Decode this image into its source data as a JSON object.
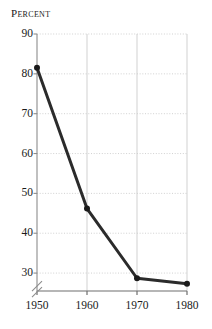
{
  "chart_data": {
    "type": "line",
    "title": "",
    "ylabel": "Percent",
    "xlabel": "",
    "x": [
      1950,
      1960,
      1970,
      1980
    ],
    "categories": [
      "1950",
      "1960",
      "1970",
      "1980"
    ],
    "values": [
      81.5,
      46.2,
      28.7,
      27.3
    ],
    "series": [
      {
        "name": "Percent",
        "values": [
          81.5,
          46.2,
          28.7,
          27.3
        ]
      }
    ],
    "xlim": [
      1950,
      1980
    ],
    "ylim": [
      25.5,
      90
    ],
    "yticks": [
      90,
      80,
      70,
      60,
      50,
      40,
      30
    ],
    "ytick_labels": [
      "90",
      "80",
      "70",
      "60",
      "50",
      "40",
      "30"
    ],
    "xticks": [
      1950,
      1960,
      1970,
      1980
    ],
    "xtick_labels": [
      "1950",
      "1960",
      "1970",
      "1980"
    ],
    "grid": true,
    "grid_horizontal_style": "dotted",
    "grid_vertical_style": "solid",
    "legend": "none",
    "axis_break": {
      "present": true,
      "axis": "y",
      "symbol": "double-slash",
      "below_value": 30
    },
    "marker": "circle",
    "colors": {
      "line": "#2b2b2b",
      "marker": "#1a1a1a",
      "grid": "#cccccc",
      "axis": "#8c8c8c",
      "xaxis": "#6e6e6e",
      "text": "#1a1a1a",
      "background": "#ffffff"
    }
  }
}
